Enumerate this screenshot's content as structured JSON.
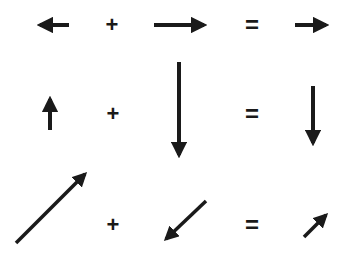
{
  "diagram": {
    "title": "",
    "ink_color": "#1a1a1a",
    "background": "#ffffff",
    "rows": [
      {
        "operand_a": {
          "direction": "left",
          "icon": "arrow-left-icon",
          "from": [
            69,
            25
          ],
          "to": [
            33,
            25
          ]
        },
        "operator": "+",
        "operand_b": {
          "direction": "right",
          "icon": "arrow-right-icon",
          "from": [
            154,
            25
          ],
          "to": [
            211,
            25
          ]
        },
        "equals": "=",
        "result": {
          "direction": "right",
          "icon": "arrow-right-icon",
          "from": [
            295,
            25
          ],
          "to": [
            333,
            25
          ]
        }
      },
      {
        "operand_a": {
          "direction": "up",
          "icon": "arrow-up-icon",
          "from": [
            50,
            130
          ],
          "to": [
            50,
            92
          ]
        },
        "operator": "+",
        "operand_b": {
          "direction": "down",
          "icon": "arrow-down-icon",
          "from": [
            179,
            62
          ],
          "to": [
            179,
            162
          ]
        },
        "equals": "=",
        "result": {
          "direction": "down",
          "icon": "arrow-down-icon",
          "from": [
            313,
            86
          ],
          "to": [
            313,
            150
          ]
        }
      },
      {
        "operand_a": {
          "direction": "up-right",
          "icon": "arrow-up-right-icon",
          "from": [
            16,
            243
          ],
          "to": [
            90,
            169
          ]
        },
        "operator": "+",
        "operand_b": {
          "direction": "down-left",
          "icon": "arrow-down-left-icon",
          "from": [
            206,
            201
          ],
          "to": [
            161,
            244
          ]
        },
        "equals": "=",
        "result": {
          "direction": "up-right",
          "icon": "arrow-up-right-icon",
          "from": [
            304,
            237
          ],
          "to": [
            330,
            210
          ]
        }
      }
    ]
  }
}
